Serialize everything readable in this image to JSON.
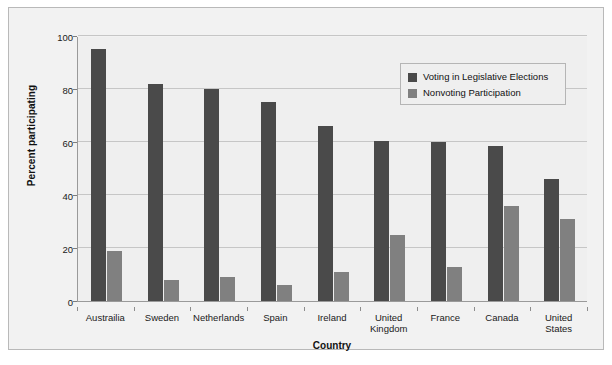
{
  "chart_data": {
    "type": "bar",
    "title": "",
    "xlabel": "Country",
    "ylabel": "Percent participating",
    "ylim": [
      0,
      100
    ],
    "yticks": [
      0,
      20,
      40,
      60,
      80,
      100
    ],
    "grid": true,
    "legend_position": "top-right",
    "categories": [
      "Austrailia",
      "Sweden",
      "Netherlands",
      "Spain",
      "Ireland",
      "United Kingdom",
      "France",
      "Canada",
      "United States"
    ],
    "category_lines": [
      [
        "Austrailia"
      ],
      [
        "Sweden"
      ],
      [
        "Netherlands"
      ],
      [
        "Spain"
      ],
      [
        "Ireland"
      ],
      [
        "United",
        "Kingdom"
      ],
      [
        "France"
      ],
      [
        "Canada"
      ],
      [
        "United",
        "States"
      ]
    ],
    "series": [
      {
        "name": "Voting in Legislative Elections",
        "color": "#4a4a4a",
        "values": [
          95,
          82,
          80,
          75,
          66,
          60.5,
          60,
          58.5,
          46
        ]
      },
      {
        "name": "Nonvoting Participation",
        "color": "#808080",
        "values": [
          19,
          8,
          9,
          6,
          11,
          25,
          13,
          36,
          31
        ]
      }
    ]
  },
  "legend": {
    "items": [
      {
        "label": "Voting in Legislative Elections"
      },
      {
        "label": "Nonvoting Participation"
      }
    ]
  },
  "axes": {
    "y_title": "Percent participating",
    "x_title": "Country"
  }
}
